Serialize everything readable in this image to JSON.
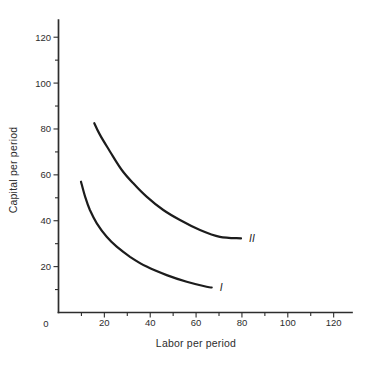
{
  "figure": {
    "background_color": "#ffffff",
    "axis_color": "#2d2d2d",
    "curve_color": "#1c1c1c"
  },
  "chart_data": {
    "type": "line",
    "title": "",
    "xlabel": "Labor per period",
    "ylabel": "Capital per period",
    "xlim": [
      0,
      128
    ],
    "ylim": [
      0,
      127.5
    ],
    "grid": false,
    "legend_position": "none",
    "x_axis": {
      "origin_label": "0",
      "major_ticks": [
        20,
        40,
        60,
        80,
        100,
        120
      ],
      "minor_ticks": [
        10,
        30,
        50,
        70,
        90,
        110
      ]
    },
    "y_axis": {
      "major_ticks": [
        20,
        40,
        60,
        80,
        100,
        120
      ],
      "minor_ticks": [
        10,
        30,
        50,
        70,
        90,
        110
      ]
    },
    "series": [
      {
        "name": "I",
        "label": "I",
        "points": [
          [
            9.8,
            57.0
          ],
          [
            11.6,
            50.5
          ],
          [
            13.7,
            44.7
          ],
          [
            16.7,
            38.9
          ],
          [
            21.0,
            33.0
          ],
          [
            25.4,
            28.7
          ],
          [
            31.2,
            24.3
          ],
          [
            38.4,
            20.0
          ],
          [
            47.2,
            16.3
          ],
          [
            55.9,
            13.4
          ],
          [
            64.6,
            11.2
          ],
          [
            66.8,
            10.9
          ]
        ]
      },
      {
        "name": "II",
        "label": "II",
        "points": [
          [
            15.6,
            82.5
          ],
          [
            18.1,
            77.4
          ],
          [
            22.5,
            70.1
          ],
          [
            27.6,
            62.1
          ],
          [
            32.6,
            56.3
          ],
          [
            38.4,
            50.5
          ],
          [
            45.7,
            44.7
          ],
          [
            53.0,
            40.3
          ],
          [
            61.7,
            36.0
          ],
          [
            70.4,
            33.0
          ],
          [
            79.6,
            32.3
          ]
        ]
      }
    ]
  }
}
